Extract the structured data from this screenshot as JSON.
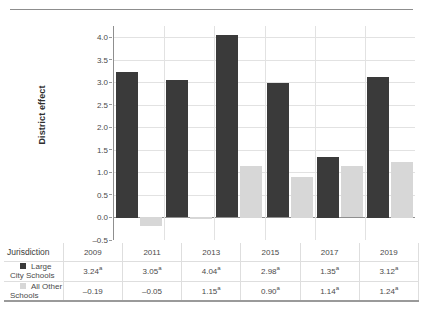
{
  "chart_data": {
    "type": "bar",
    "title": "",
    "xlabel": "",
    "ylabel": "District effect",
    "categories": [
      "2009",
      "2011",
      "2013",
      "2015",
      "2017",
      "2019"
    ],
    "series": [
      {
        "name": "Large City Schools",
        "color": "#3a3a3a",
        "values": [
          3.24,
          3.05,
          4.04,
          2.98,
          1.35,
          3.12
        ],
        "labels": [
          "3.24",
          "3.05",
          "4.04",
          "2.98",
          "1.35",
          "3.12"
        ],
        "notes": [
          "a",
          "a",
          "a",
          "a",
          "a",
          "a"
        ]
      },
      {
        "name": "All Other Schools",
        "color": "#d7d7d7",
        "values": [
          -0.19,
          -0.05,
          1.15,
          0.9,
          1.14,
          1.24
        ],
        "labels": [
          "–0.19",
          "–0.05",
          "1.15",
          "0.90",
          "1.14",
          "1.24"
        ],
        "notes": [
          "",
          "",
          "a",
          "a",
          "a",
          "a"
        ]
      }
    ],
    "ylim": [
      -0.5,
      4.25
    ],
    "yticks": [
      4.0,
      3.5,
      3.0,
      2.5,
      2.0,
      1.5,
      1.0,
      0.5,
      0.0,
      -0.5
    ],
    "ytick_labels": [
      "4.0",
      "3.5",
      "3.0",
      "2.5",
      "2.0",
      "1.5",
      "1.0",
      "0.5",
      "0.0",
      "–0.5"
    ],
    "grid": true,
    "legend_position": "table"
  },
  "table": {
    "row_header_label": "Jurisdiction",
    "column_headers": [
      "2009",
      "2011",
      "2013",
      "2015",
      "2017",
      "2019"
    ],
    "rows": [
      {
        "label": "Large City Schools",
        "swatch": "dark",
        "cells": [
          {
            "value": "3.24",
            "note": "a"
          },
          {
            "value": "3.05",
            "note": "a"
          },
          {
            "value": "4.04",
            "note": "a"
          },
          {
            "value": "2.98",
            "note": "a"
          },
          {
            "value": "1.35",
            "note": "a"
          },
          {
            "value": "3.12",
            "note": "a"
          }
        ]
      },
      {
        "label": "All Other Schools",
        "swatch": "light",
        "cells": [
          {
            "value": "–0.19",
            "note": ""
          },
          {
            "value": "–0.05",
            "note": ""
          },
          {
            "value": "1.15",
            "note": "a"
          },
          {
            "value": "0.90",
            "note": "a"
          },
          {
            "value": "1.14",
            "note": "a"
          },
          {
            "value": "1.24",
            "note": "a"
          }
        ]
      }
    ]
  },
  "colors": {
    "dark_series": "#3a3a3a",
    "light_series": "#d7d7d7",
    "gridline": "#e2e2e2",
    "axis": "#8f8f8f",
    "text": "#4a4a4a"
  }
}
